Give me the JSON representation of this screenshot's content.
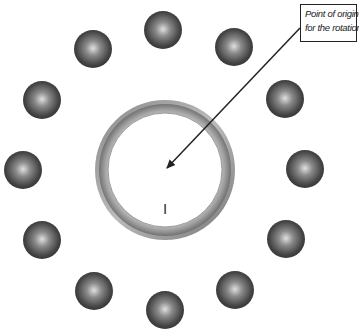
{
  "diagram": {
    "type": "rotation-pattern",
    "callout": {
      "line1": "Point of origin",
      "line2": "for the rotation"
    },
    "center_label": "I",
    "ring": {
      "cx": 165,
      "cy": 170,
      "outer_r": 70,
      "inner_r": 57
    },
    "ball_radius": 19,
    "balls": [
      {
        "cx": 163,
        "cy": 30
      },
      {
        "cx": 234,
        "cy": 47
      },
      {
        "cx": 285,
        "cy": 99
      },
      {
        "cx": 305,
        "cy": 169
      },
      {
        "cx": 286,
        "cy": 239
      },
      {
        "cx": 235,
        "cy": 290
      },
      {
        "cx": 165,
        "cy": 310
      },
      {
        "cx": 94,
        "cy": 291
      },
      {
        "cx": 42,
        "cy": 240
      },
      {
        "cx": 23,
        "cy": 170
      },
      {
        "cx": 42,
        "cy": 100
      },
      {
        "cx": 93,
        "cy": 49
      }
    ],
    "arrow": {
      "from": [
        300,
        28
      ],
      "to": [
        165,
        170
      ]
    },
    "colors": {
      "ball_dark": "#3a3a3a",
      "ball_highlight": "#d8d8d8",
      "ring_dark": "#6e6e6e",
      "ring_light": "#c8c8c8",
      "line": "#222222"
    }
  }
}
